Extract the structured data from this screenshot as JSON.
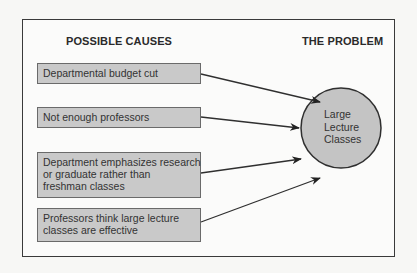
{
  "headings": {
    "causes": "POSSIBLE CAUSES",
    "problem": "THE PROBLEM"
  },
  "causes": [
    {
      "lines": [
        "Departmental budget cut"
      ]
    },
    {
      "lines": [
        "Not enough professors"
      ]
    },
    {
      "lines": [
        "Department emphasizes research",
        "or graduate rather than",
        "freshman classes"
      ]
    },
    {
      "lines": [
        "Professors think large lecture",
        "classes are effective"
      ]
    }
  ],
  "problem": {
    "lines": [
      "Large",
      "Lecture",
      "Classes"
    ]
  },
  "colors": {
    "box_fill": "#c9c9c9",
    "circle_fill": "#c4c4c4",
    "stroke": "#2f2f2f",
    "background": "#fbfbfa"
  }
}
